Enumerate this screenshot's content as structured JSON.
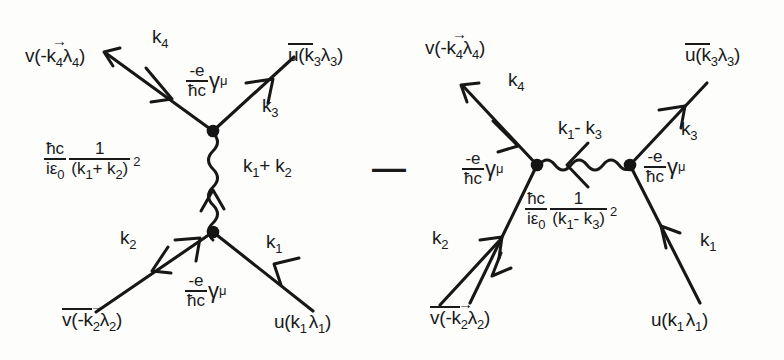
{
  "figure": {
    "background_color": "#fdfdfc",
    "ink_color": "#1a1a1a",
    "operator_between_diagrams": "—"
  },
  "diagram_left": {
    "name": "annihilation-channel-diagram",
    "labels": {
      "incoming_positron_spinor": "v(-k",
      "incoming_positron_spinor_sub": "4",
      "incoming_positron_spinor_lambda": "λ",
      "incoming_positron_spinor_lambda_sub": "4",
      "incoming_positron_spinor_close": ")",
      "outgoing_k4": "k",
      "outgoing_k4_sub": "4",
      "outgoing_ubar": "u(k",
      "outgoing_ubar_sub3a": "3",
      "outgoing_ubar_lambda": "λ",
      "outgoing_ubar_sub3b": "3",
      "outgoing_ubar_close": ")",
      "k3": "k",
      "k3_sub": "3",
      "k2": "k",
      "k2_sub": "2",
      "k1": "k",
      "k1_sub": "1",
      "photon_momentum": "k",
      "photon_momentum_sub1": "1",
      "photon_momentum_plus": "+ k",
      "photon_momentum_sub2": "2",
      "vbar": "v(-k",
      "vbar_sub2a": "2",
      "vbar_lambda": "λ",
      "vbar_sub2b": "2",
      "vbar_close": ")",
      "u_in": "u(k",
      "u_in_sub1a": "1",
      "u_in_lambda": "λ",
      "u_in_sub1b": "1",
      "u_in_close": ")"
    },
    "vertex_factor_top": {
      "numerator": "-e",
      "denominator": "ħc",
      "gamma": "γ",
      "gamma_index": "μ"
    },
    "vertex_factor_bottom": {
      "numerator": "-e",
      "denominator": "ħc",
      "gamma": "γ",
      "gamma_index": "μ"
    },
    "propagator": {
      "first_num": "ħc",
      "first_den": "iε",
      "first_den_sub": "0",
      "second_num": "1",
      "second_den": "(k",
      "second_den_sub1": "1",
      "second_den_op": "+ k",
      "second_den_sub2": "2",
      "second_den_close": ")",
      "second_den_power": "2"
    }
  },
  "diagram_right": {
    "name": "exchange-channel-diagram",
    "labels": {
      "incoming_positron_spinor": "v(-k",
      "incoming_positron_spinor_sub": "4",
      "incoming_positron_spinor_lambda": "λ",
      "incoming_positron_spinor_lambda_sub": "4",
      "incoming_positron_spinor_close": ")",
      "outgoing_k4": "k",
      "outgoing_k4_sub": "4",
      "outgoing_ubar": "u(k",
      "outgoing_ubar_sub3a": "3",
      "outgoing_ubar_lambda": "λ",
      "outgoing_ubar_sub3b": "3",
      "outgoing_ubar_close": ")",
      "k3": "k",
      "k3_sub": "3",
      "k2": "k",
      "k2_sub": "2",
      "k1": "k",
      "k1_sub": "1",
      "photon_momentum": "k",
      "photon_momentum_sub1": "1",
      "photon_momentum_minus": "- k",
      "photon_momentum_sub3": "3",
      "vbar": "v(-k",
      "vbar_sub2a": "2",
      "vbar_lambda": "λ",
      "vbar_sub2b": "2",
      "vbar_close": ")",
      "u_in": "u(k",
      "u_in_sub1a": "1",
      "u_in_lambda": "λ",
      "u_in_sub1b": "1",
      "u_in_close": ")"
    },
    "vertex_factor_left": {
      "numerator": "-e",
      "denominator": "ħc",
      "gamma": "γ",
      "gamma_index": "μ"
    },
    "vertex_factor_right": {
      "numerator": "-e",
      "denominator": "ħc",
      "gamma": "γ",
      "gamma_index": "μ"
    },
    "propagator": {
      "first_num": "ħc",
      "first_den": "iε",
      "first_den_sub": "0",
      "second_num": "1",
      "second_den": "(k",
      "second_den_sub1": "1",
      "second_den_op": "- k",
      "second_den_sub3": "3",
      "second_den_close": ")",
      "second_den_power": "2"
    }
  }
}
